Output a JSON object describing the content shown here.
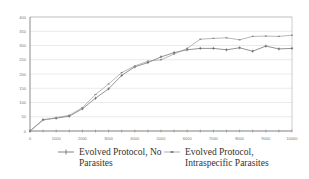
{
  "chart_data": {
    "type": "line",
    "title": "",
    "xlabel": "",
    "ylabel": "",
    "xlim": [
      0,
      10000
    ],
    "ylim": [
      0,
      400
    ],
    "grid": true,
    "legend_position": "bottom",
    "x_ticks": [
      "0",
      "1000",
      "2000",
      "3000",
      "4000",
      "5000",
      "6000",
      "7000",
      "8000",
      "9000",
      "10000"
    ],
    "y_ticks": [
      "0",
      "50",
      "100",
      "150",
      "200",
      "250",
      "300",
      "350",
      "400"
    ],
    "x": [
      0,
      500,
      1000,
      1500,
      2000,
      2500,
      3000,
      3500,
      4000,
      4500,
      5000,
      5500,
      6000,
      6500,
      7000,
      7500,
      8000,
      8500,
      9000,
      9500,
      10000
    ],
    "series": [
      {
        "name": "Evolved Protocol, No Parasites",
        "marker": "plus",
        "color": "#666666",
        "values": [
          0,
          40,
          45,
          52,
          78,
          115,
          148,
          195,
          225,
          240,
          260,
          275,
          285,
          290,
          290,
          285,
          292,
          280,
          298,
          288,
          290
        ]
      },
      {
        "name": "Evolved Protocol, Intraspecific Parasites",
        "marker": "dash",
        "color": "#999999",
        "values": [
          0,
          38,
          47,
          55,
          82,
          128,
          165,
          205,
          228,
          245,
          250,
          270,
          290,
          322,
          325,
          327,
          320,
          332,
          333,
          332,
          336
        ]
      }
    ]
  },
  "legend": {
    "items": [
      {
        "line1": "Evolved Protocol, No",
        "line2": "Parasites"
      },
      {
        "line1": "Evolved Protocol,",
        "line2": "Intraspecific Parasites"
      }
    ]
  }
}
